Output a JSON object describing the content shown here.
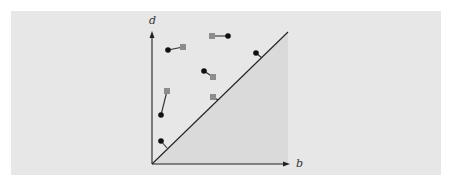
{
  "diagram": {
    "type": "persistence-diagram-matching",
    "axes": {
      "x_label": "b",
      "y_label": "d"
    },
    "colors": {
      "panel_bg": "#e7e7e7",
      "shaded_region": "#dadada",
      "axis": "#222222",
      "diagram_a_point": "#111111",
      "diagram_b_point": "#8c8c8c",
      "match_line": "#333333"
    },
    "matched_pairs": [
      {
        "from": {
          "shape": "circle",
          "x": 168,
          "y": 50
        },
        "to": {
          "shape": "square",
          "x": 183,
          "y": 47
        }
      },
      {
        "from": {
          "shape": "square",
          "x": 212,
          "y": 36
        },
        "to": {
          "shape": "circle",
          "x": 228,
          "y": 36
        }
      },
      {
        "from": {
          "shape": "circle",
          "x": 204,
          "y": 71
        },
        "to": {
          "shape": "square",
          "x": 213,
          "y": 77
        }
      },
      {
        "from": {
          "shape": "square",
          "x": 167,
          "y": 91
        },
        "to": {
          "shape": "circle",
          "x": 161,
          "y": 115
        }
      }
    ],
    "diagonal_matches": [
      {
        "shape": "circle",
        "x": 161,
        "y": 141,
        "proj": {
          "x": 167,
          "y": 148
        }
      },
      {
        "shape": "square",
        "x": 213,
        "y": 97,
        "proj": {
          "x": 218,
          "y": 100
        }
      },
      {
        "shape": "circle",
        "x": 256,
        "y": 53,
        "proj": {
          "x": 262,
          "y": 58
        }
      }
    ]
  }
}
